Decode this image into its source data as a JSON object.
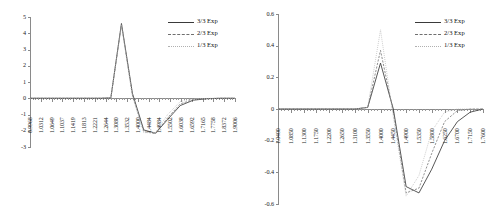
{
  "figure": {
    "panel_count": 2,
    "background": "#ffffff",
    "series_colors": {
      "s33": "#3a3a3a",
      "s23": "#6f6f6f",
      "s13": "#b8b8b8"
    }
  },
  "legend": {
    "items": [
      {
        "label": "3/3 Exp",
        "style": "solid"
      },
      {
        "label": "2/3 Exp",
        "style": "dashed"
      },
      {
        "label": "1/3 Exp",
        "style": "dotted"
      }
    ]
  },
  "chart_data": [
    {
      "type": "line",
      "panel": "left",
      "title": "",
      "xlabel": "",
      "ylabel": "",
      "xlim": [
        0.9968,
        1.9006
      ],
      "ylim": [
        -3,
        5
      ],
      "yticks": [
        5,
        4,
        3,
        2,
        1,
        0,
        -1,
        -2,
        -3
      ],
      "ytick_labels": [
        "5",
        "4",
        "3",
        "2",
        "1",
        "0",
        "-1",
        "-2",
        "-3"
      ],
      "grid": false,
      "legend_position": "top-right",
      "xtick_labels": [
        "0.9968",
        "1.0312",
        "1.0649",
        "1.1037",
        "1.1419",
        "1.1813",
        "1.2221",
        "1.2644",
        "1.3080",
        "1.3532",
        "1.4000",
        "1.4484",
        "1.4984",
        "1.5502",
        "1.6038",
        "1.6592",
        "1.7165",
        "1.7758",
        "1.8372",
        "1.9006"
      ],
      "x": [
        0.9968,
        1.0312,
        1.0649,
        1.1037,
        1.1419,
        1.1813,
        1.2221,
        1.2644,
        1.308,
        1.3532,
        1.4,
        1.4484,
        1.4984,
        1.5502,
        1.6038,
        1.6592,
        1.7165,
        1.7758,
        1.8372,
        1.9006
      ],
      "series": [
        {
          "name": "3/3 Exp",
          "style": "solid",
          "values": [
            0,
            0,
            0,
            0,
            0,
            0,
            0,
            0,
            0,
            0.02,
            4.6,
            0.3,
            -1.95,
            -2.15,
            -1.3,
            -0.45,
            -0.12,
            -0.03,
            0,
            0
          ]
        },
        {
          "name": "2/3 Exp",
          "style": "dashed",
          "values": [
            0,
            0,
            0,
            0,
            0,
            0,
            0,
            0,
            0,
            0.02,
            4.55,
            0.2,
            -2.05,
            -2.18,
            -1.2,
            -0.35,
            -0.08,
            -0.02,
            0,
            0
          ]
        },
        {
          "name": "1/3 Exp",
          "style": "dotted",
          "values": [
            0,
            0,
            0,
            0,
            0,
            0,
            0,
            0,
            0,
            0.02,
            4.5,
            0.1,
            -2.12,
            -2.1,
            -1.0,
            -0.2,
            -0.05,
            -0.01,
            0,
            0
          ]
        }
      ]
    },
    {
      "type": "line",
      "panel": "right",
      "title": "",
      "xlabel": "",
      "ylabel": "",
      "xlim": [
        1.04,
        1.76
      ],
      "ylim": [
        -0.6,
        0.6
      ],
      "yticks": [
        0.6,
        0.4,
        0.2,
        0,
        -0.2,
        -0.4,
        -0.6
      ],
      "ytick_labels": [
        "0.6",
        "0.4",
        "0.2",
        "0",
        "-0.2",
        "-0.4",
        "-0.6"
      ],
      "grid": false,
      "legend_position": "top-right",
      "xtick_labels": [
        "1.0400",
        "1.0850",
        "1.1300",
        "1.1750",
        "1.2200",
        "1.2650",
        "1.3100",
        "1.3550",
        "1.4000",
        "1.4450",
        "1.4900",
        "1.5350",
        "1.5800",
        "1.6250",
        "1.6700",
        "1.7150",
        "1.7600"
      ],
      "x": [
        1.04,
        1.085,
        1.13,
        1.175,
        1.22,
        1.265,
        1.31,
        1.355,
        1.4,
        1.445,
        1.49,
        1.535,
        1.58,
        1.625,
        1.67,
        1.715,
        1.76
      ],
      "series": [
        {
          "name": "3/3 Exp",
          "style": "solid",
          "values": [
            0,
            0,
            0,
            0,
            0,
            0,
            0,
            0.01,
            0.29,
            0.0,
            -0.49,
            -0.53,
            -0.38,
            -0.2,
            -0.08,
            -0.02,
            0.0
          ]
        },
        {
          "name": "2/3 Exp",
          "style": "dashed",
          "values": [
            0,
            0,
            0,
            0,
            0,
            0,
            0,
            0.01,
            0.37,
            -0.02,
            -0.53,
            -0.5,
            -0.28,
            -0.08,
            -0.01,
            0.0,
            0.0
          ]
        },
        {
          "name": "1/3 Exp",
          "style": "dotted",
          "values": [
            0,
            0,
            0,
            0,
            0,
            0,
            0,
            0.01,
            0.5,
            -0.05,
            -0.55,
            -0.42,
            -0.14,
            -0.02,
            0.0,
            0.0,
            0.0
          ]
        }
      ]
    }
  ]
}
